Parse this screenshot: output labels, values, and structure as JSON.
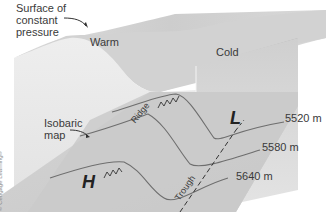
{
  "figure": {
    "labels": {
      "surface": "Surface of constant pressure",
      "surface_line1": "Surface of",
      "surface_line2": "constant",
      "surface_line3": "pressure",
      "warm": "Warm",
      "cold": "Cold",
      "isobaric_line1": "Isobaric",
      "isobaric_line2": "map",
      "ridge": "Ridge",
      "trough": "Trough",
      "high": "H",
      "low": "L",
      "copyright": "© Cengage Learning®"
    },
    "contours": [
      {
        "label": "5520 m",
        "height_m": 5520
      },
      {
        "label": "5580 m",
        "height_m": 5580
      },
      {
        "label": "5640 m",
        "height_m": 5640
      }
    ],
    "colors": {
      "surface_light": "#e4e4e4",
      "surface_mid": "#cfcfcf",
      "surface_dark": "#a9a9a9",
      "map_plane": "#cdcdcd",
      "contour_line": "#6e6e6e",
      "text": "#3a3a3a"
    }
  }
}
